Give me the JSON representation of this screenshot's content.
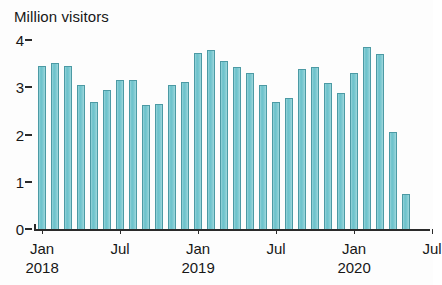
{
  "chart_data": {
    "type": "bar",
    "title": "Million visitors",
    "subtitle": "",
    "xlabel": "",
    "ylabel": "Million visitors",
    "ylim": [
      0,
      4
    ],
    "y_ticks": [
      0,
      1,
      2,
      3,
      4
    ],
    "y_tick_labels": [
      "0",
      "1",
      "2",
      "3",
      "4"
    ],
    "grid": false,
    "legend": null,
    "legend_position": "none",
    "bar_color": "#6ec3cc",
    "bar_edge_color": "#4c9aa4",
    "axis_color": "#2a2a2a",
    "background_color": "#fdfdfd",
    "x_axis_range_months": [
      "2018-01",
      "2020-07"
    ],
    "x_tick_labels": [
      "Jan",
      "Jul",
      "Jan",
      "Jul",
      "Jan",
      "Jul"
    ],
    "x_tick_years": [
      "2018",
      "",
      "2019",
      "",
      "2020",
      ""
    ],
    "x_ticks": [
      {
        "label": "Jan",
        "year": "2018",
        "month_index": 0
      },
      {
        "label": "Jul",
        "year": "",
        "month_index": 6
      },
      {
        "label": "Jan",
        "year": "2019",
        "month_index": 12
      },
      {
        "label": "Jul",
        "year": "",
        "month_index": 18
      },
      {
        "label": "Jan",
        "year": "2020",
        "month_index": 24
      },
      {
        "label": "Jul",
        "year": "",
        "month_index": 30
      }
    ],
    "categories": [
      "Jan 2018",
      "Feb 2018",
      "Mar 2018",
      "Apr 2018",
      "May 2018",
      "Jun 2018",
      "Jul 2018",
      "Aug 2018",
      "Sep 2018",
      "Oct 2018",
      "Nov 2018",
      "Dec 2018",
      "Jan 2019",
      "Feb 2019",
      "Mar 2019",
      "Apr 2019",
      "May 2019",
      "Jun 2019",
      "Jul 2019",
      "Aug 2019",
      "Sep 2019",
      "Oct 2019",
      "Nov 2019",
      "Dec 2019",
      "Jan 2020",
      "Feb 2020",
      "Mar 2020"
    ],
    "values": [
      3.45,
      3.52,
      3.45,
      3.05,
      2.68,
      2.95,
      3.15,
      3.15,
      2.62,
      2.65,
      3.05,
      3.12,
      3.72,
      3.78,
      3.55,
      3.42,
      3.3,
      3.05,
      2.68,
      2.78,
      3.38,
      3.42,
      3.1,
      2.88,
      3.3,
      3.85,
      3.7
    ],
    "trailing_values": [
      2.05,
      0.75
    ],
    "trailing_categories": [
      "Apr 2020",
      "May 2020"
    ]
  }
}
